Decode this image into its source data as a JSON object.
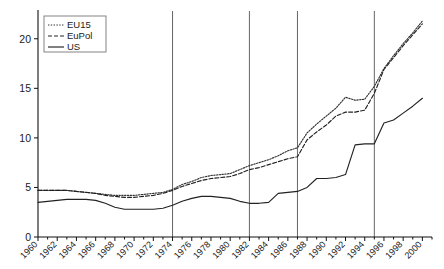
{
  "chart_data": {
    "type": "line",
    "title": "",
    "xlabel": "",
    "ylabel": "",
    "xlim": [
      1960,
      2001
    ],
    "ylim": [
      0,
      22.5
    ],
    "grid": false,
    "legend_position": "top-left",
    "ytick_labels": [
      "0",
      "5",
      "10",
      "15",
      "20"
    ],
    "ytick_values": [
      0,
      5,
      10,
      15,
      20
    ],
    "xtick_labels": [
      "1960",
      "1962",
      "1964",
      "1966",
      "1968",
      "1970",
      "1972",
      "1974",
      "1976",
      "1978",
      "1980",
      "1982",
      "1984",
      "1986",
      "1988",
      "1990",
      "1992",
      "1994",
      "1996",
      "1998",
      "2000"
    ],
    "xtick_values": [
      1960,
      1962,
      1964,
      1966,
      1968,
      1970,
      1972,
      1974,
      1976,
      1978,
      1980,
      1982,
      1984,
      1986,
      1988,
      1990,
      1992,
      1994,
      1996,
      1998,
      2000
    ],
    "x": [
      1960,
      1961,
      1962,
      1963,
      1964,
      1965,
      1966,
      1967,
      1968,
      1969,
      1970,
      1971,
      1972,
      1973,
      1974,
      1975,
      1976,
      1977,
      1978,
      1979,
      1980,
      1981,
      1982,
      1983,
      1984,
      1985,
      1986,
      1987,
      1988,
      1989,
      1990,
      1991,
      1992,
      1993,
      1994,
      1995,
      1996,
      1997,
      1998,
      1999,
      2000
    ],
    "series": [
      {
        "name": "EU15",
        "style": "dotted",
        "color": "#333333",
        "values": [
          4.7,
          4.7,
          4.7,
          4.7,
          4.6,
          4.5,
          4.4,
          4.3,
          4.2,
          4.2,
          4.2,
          4.3,
          4.4,
          4.5,
          4.8,
          5.3,
          5.6,
          6.0,
          6.2,
          6.3,
          6.4,
          6.8,
          7.2,
          7.5,
          7.8,
          8.2,
          8.7,
          9.0,
          10.5,
          11.4,
          12.2,
          13.0,
          14.1,
          13.8,
          13.9,
          15.2,
          17.0,
          18.3,
          19.5,
          20.6,
          21.8
        ]
      },
      {
        "name": "EuPol",
        "style": "dashed",
        "color": "#222222",
        "values": [
          4.7,
          4.7,
          4.7,
          4.7,
          4.6,
          4.5,
          4.4,
          4.2,
          4.1,
          4.0,
          4.0,
          4.1,
          4.2,
          4.4,
          4.7,
          5.1,
          5.4,
          5.7,
          5.9,
          6.0,
          6.1,
          6.4,
          6.8,
          7.0,
          7.3,
          7.6,
          7.9,
          8.1,
          9.8,
          10.6,
          11.3,
          12.2,
          12.6,
          12.6,
          12.8,
          14.5,
          16.9,
          18.1,
          19.3,
          20.4,
          21.5
        ]
      },
      {
        "name": "US",
        "style": "solid",
        "color": "#222222",
        "values": [
          3.5,
          3.6,
          3.7,
          3.8,
          3.8,
          3.8,
          3.7,
          3.4,
          3.0,
          2.8,
          2.8,
          2.8,
          2.8,
          2.9,
          3.2,
          3.6,
          3.9,
          4.1,
          4.1,
          4.0,
          3.9,
          3.6,
          3.4,
          3.4,
          3.5,
          4.4,
          4.5,
          4.6,
          5.0,
          5.9,
          5.9,
          6.0,
          6.3,
          9.3,
          9.4,
          9.4,
          11.5,
          11.8,
          12.5,
          13.2,
          14.0
        ]
      }
    ],
    "vertical_reference_lines": [
      1974,
      1982,
      1987,
      1995
    ]
  }
}
